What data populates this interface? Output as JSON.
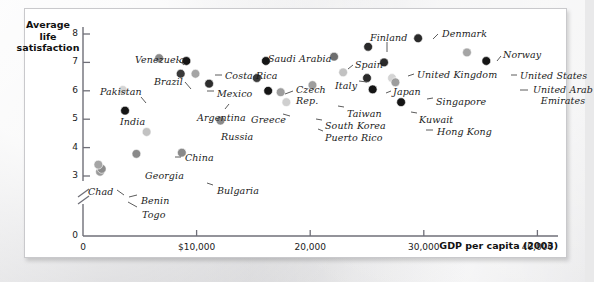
{
  "figure": {
    "y_axis_title": "Average\nlife\nsatisfaction",
    "x_axis_title": "GDP per capita (2003)"
  },
  "chart_data": {
    "type": "scatter",
    "title": "",
    "xlabel": "GDP per capita (2003)",
    "ylabel": "Average life satisfaction",
    "xlim": [
      0,
      43500
    ],
    "ylim": [
      2.6,
      8.3
    ],
    "grid": false,
    "legend": null,
    "y_axis_break": true,
    "y_break_note": "axis broken between 0 and 3",
    "xticks": [
      "0",
      "$10,000",
      "20,000",
      "30,000",
      "40,000"
    ],
    "xtick_values": [
      0,
      10000,
      20000,
      30000,
      40000
    ],
    "yticks": [
      "0",
      "3",
      "4",
      "5",
      "6",
      "7",
      "8"
    ],
    "ytick_values": [
      0,
      3,
      4,
      5,
      6,
      7,
      8
    ],
    "points": [
      {
        "label": "Togo",
        "x": 1500,
        "y": 3.15,
        "shade": "#9a9a9a",
        "lx": 117,
        "ly": 201,
        "anchor": "start",
        "leader": [
          [
            112,
            198
          ],
          [
            103,
            193
          ]
        ]
      },
      {
        "label": "Benin",
        "x": 1650,
        "y": 3.25,
        "shade": "#8c8c8c",
        "lx": 116,
        "ly": 187,
        "anchor": "start",
        "leader": [
          [
            112,
            186
          ],
          [
            104,
            188
          ]
        ]
      },
      {
        "label": "Chad",
        "x": 1350,
        "y": 3.4,
        "shade": "#a5a5a5",
        "lx": 63,
        "ly": 178,
        "anchor": "start",
        "leader": [
          [
            92,
            181
          ],
          [
            99,
            186
          ]
        ]
      },
      {
        "label": "Georgia",
        "x": 4700,
        "y": 3.78,
        "shade": "#8a8a8a",
        "lx": 120,
        "ly": 162,
        "anchor": "start",
        "leader": null
      },
      {
        "label": "Bulgaria",
        "x": 8700,
        "y": 3.82,
        "shade": "#8a8a8a",
        "lx": 192,
        "ly": 177,
        "anchor": "start",
        "leader": [
          [
            188,
            176
          ],
          [
            182,
            174
          ]
        ]
      },
      {
        "label": "China",
        "x": 5600,
        "y": 4.55,
        "shade": "#c2c2c2",
        "lx": 160,
        "ly": 144,
        "anchor": "start",
        "leader": [
          [
            156,
            148
          ],
          [
            150,
            148
          ]
        ]
      },
      {
        "label": "Russia",
        "x": 12100,
        "y": 4.95,
        "shade": "#8a8a8a",
        "lx": 196,
        "ly": 123,
        "anchor": "start",
        "leader": null
      },
      {
        "label": "India",
        "x": 3700,
        "y": 5.3,
        "shade": "#151515",
        "lx": 95,
        "ly": 108,
        "anchor": "start",
        "leader": null
      },
      {
        "label": "Puerto Rico",
        "x": 17900,
        "y": 5.6,
        "shade": "#cfcfcf",
        "lx": 300,
        "ly": 124,
        "anchor": "start",
        "leader": [
          [
            298,
            122
          ],
          [
            293,
            120
          ]
        ]
      },
      {
        "label": "Hong Kong",
        "x": 28000,
        "y": 5.6,
        "shade": "#151515",
        "lx": 412,
        "ly": 118,
        "anchor": "start",
        "leader": [
          [
            408,
            121
          ],
          [
            401,
            121
          ]
        ]
      },
      {
        "label": "South Korea",
        "x": 17400,
        "y": 5.95,
        "shade": "#9d9d9d",
        "lx": 300,
        "ly": 112,
        "anchor": "start",
        "leader": [
          [
            297,
            111
          ],
          [
            291,
            110
          ]
        ]
      },
      {
        "label": "Kuwait",
        "x": 25500,
        "y": 6.05,
        "shade": "#151515",
        "lx": 394,
        "ly": 106,
        "anchor": "start",
        "leader": [
          [
            392,
            104
          ],
          [
            386,
            103
          ]
        ]
      },
      {
        "label": "Pakistan",
        "x": 3500,
        "y": 6.03,
        "shade": "#d4d4d4",
        "lx": 75,
        "ly": 78,
        "anchor": "start",
        "leader": [
          [
            116,
            88
          ],
          [
            121,
            94
          ]
        ]
      },
      {
        "label": "Taiwan",
        "x": 20200,
        "y": 6.2,
        "shade": "#9d9d9d",
        "lx": 322,
        "ly": 100,
        "anchor": "start",
        "leader": [
          [
            319,
            98
          ],
          [
            313,
            97
          ]
        ]
      },
      {
        "label": "Greece",
        "x": 16300,
        "y": 6.0,
        "shade": "#151515",
        "lx": 226,
        "ly": 106,
        "anchor": "start",
        "leader": [
          [
            258,
            105
          ],
          [
            265,
            107
          ]
        ]
      },
      {
        "label": "Argentina",
        "x": 11100,
        "y": 6.25,
        "shade": "#2d2d2d",
        "lx": 172,
        "ly": 104,
        "anchor": "start",
        "leader": [
          [
            200,
            100
          ],
          [
            204,
            95
          ]
        ]
      },
      {
        "label": "Czech Rep.",
        "x": 15300,
        "y": 6.45,
        "shade": "#3a3a3a",
        "lx": 271,
        "ly": 76,
        "anchor": "start",
        "leader": [
          [
            268,
            82
          ],
          [
            260,
            85
          ]
        ]
      },
      {
        "label": "Japan",
        "x": 25000,
        "y": 6.45,
        "shade": "#2a2a2a",
        "lx": 368,
        "ly": 78,
        "anchor": "start",
        "leader": [
          [
            366,
            82
          ],
          [
            361,
            84
          ]
        ]
      },
      {
        "label": "Italy",
        "x": 22900,
        "y": 6.65,
        "shade": "#c2c2c2",
        "lx": 310,
        "ly": 72,
        "anchor": "start",
        "leader": [
          [
            334,
            72
          ],
          [
            342,
            73
          ]
        ]
      },
      {
        "label": "Brazil",
        "x": 8600,
        "y": 6.6,
        "shade": "#3a3a3a",
        "lx": 129,
        "ly": 68,
        "anchor": "start",
        "leader": [
          [
            160,
            73
          ],
          [
            166,
            80
          ]
        ]
      },
      {
        "label": "Mexico",
        "x": 9900,
        "y": 6.6,
        "shade": "#a5a5a5",
        "lx": 192,
        "ly": 80,
        "anchor": "start",
        "leader": [
          [
            189,
            82
          ],
          [
            182,
            82
          ]
        ]
      },
      {
        "label": "Singapore",
        "x": 27200,
        "y": 6.45,
        "shade": "#d4d4d4",
        "lx": 411,
        "ly": 88,
        "anchor": "start",
        "leader": [
          [
            408,
            89
          ],
          [
            402,
            90
          ]
        ]
      },
      {
        "label": "United Arab Emirates",
        "x": 27500,
        "y": 6.3,
        "shade": "#9d9d9d",
        "lx": 507,
        "ly": 76,
        "anchor": "start",
        "leader": [
          [
            503,
            81
          ],
          [
            495,
            81
          ]
        ]
      },
      {
        "label": "United Kingdom",
        "x": 26500,
        "y": 7.0,
        "shade": "#2a2a2a",
        "lx": 392,
        "ly": 61,
        "anchor": "start",
        "leader": [
          [
            389,
            65
          ],
          [
            383,
            67
          ]
        ]
      },
      {
        "label": "Costa Rica",
        "x": 9100,
        "y": 7.05,
        "shade": "#151515",
        "lx": 200,
        "ly": 62,
        "anchor": "start",
        "leader": [
          [
            197,
            66
          ],
          [
            190,
            66
          ]
        ]
      },
      {
        "label": "Saudi Arabia",
        "x": 16100,
        "y": 7.05,
        "shade": "#151515",
        "lx": 243,
        "ly": 45,
        "anchor": "start",
        "leader": null
      },
      {
        "label": "Venezuela",
        "x": 6700,
        "y": 7.15,
        "shade": "#8a8a8a",
        "lx": 110,
        "ly": 46,
        "anchor": "start",
        "leader": [
          [
            152,
            50
          ],
          [
            159,
            56
          ]
        ]
      },
      {
        "label": "United States",
        "x": 35500,
        "y": 7.05,
        "shade": "#151515",
        "lx": 495,
        "ly": 62,
        "anchor": "start",
        "leader": [
          [
            492,
            66
          ],
          [
            486,
            66
          ]
        ]
      },
      {
        "label": "Spain",
        "x": 22100,
        "y": 7.2,
        "shade": "#6e6e6e",
        "lx": 330,
        "ly": 51,
        "anchor": "start",
        "leader": [
          [
            328,
            56
          ],
          [
            323,
            60
          ]
        ]
      },
      {
        "label": "Norway",
        "x": 33800,
        "y": 7.35,
        "shade": "#a5a5a5",
        "lx": 478,
        "ly": 41,
        "anchor": "start",
        "leader": [
          [
            476,
            47
          ],
          [
            472,
            52
          ]
        ]
      },
      {
        "label": "Finland",
        "x": 25100,
        "y": 7.55,
        "shade": "#2a2a2a",
        "lx": 345,
        "ly": 24,
        "anchor": "start",
        "leader": [
          [
            362,
            33
          ],
          [
            362,
            43
          ]
        ]
      },
      {
        "label": "Denmark",
        "x": 29500,
        "y": 7.85,
        "shade": "#2a2a2a",
        "lx": 417,
        "ly": 20,
        "anchor": "start",
        "leader": [
          [
            413,
            25
          ],
          [
            408,
            30
          ]
        ]
      }
    ]
  }
}
